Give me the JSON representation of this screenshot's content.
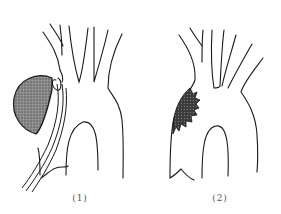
{
  "figure": {
    "panels": [
      {
        "id": "1",
        "label": "(1)",
        "description": "Aortic arch with a large stippled saccular bulge on the left side of the ascending aorta, with a tubular catheter/graft passing alongside"
      },
      {
        "id": "2",
        "label": "(2)",
        "description": "Aortic arch with a small dark spiky lesion on the left wall of the ascending aorta"
      }
    ],
    "colors": {
      "line": "#1a1a1a",
      "stipple_fill": "#7a7a7a",
      "dark_fill": "#3a3a3a",
      "background": "#ffffff"
    }
  }
}
